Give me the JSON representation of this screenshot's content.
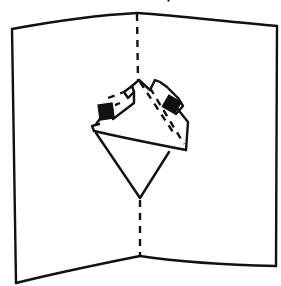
{
  "caption_fragment": "'",
  "labels": {
    "left_panel": "left-card-panel",
    "right_panel": "right-card-panel",
    "center_fold": "center-fold-dashed-line",
    "popup": "pop-up-mechanism"
  },
  "colors": {
    "ink": "#111111",
    "paper": "#ffffff"
  }
}
